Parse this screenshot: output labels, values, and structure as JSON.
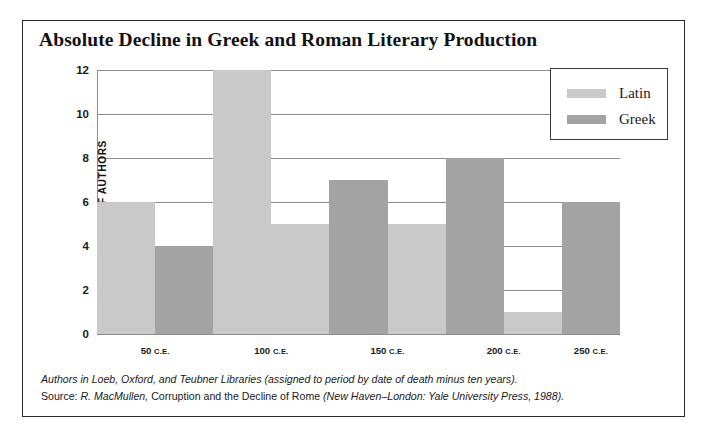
{
  "figure": {
    "title": "Absolute Decline in Greek and Roman Literary Production"
  },
  "legend": {
    "position": "top-right",
    "entries": [
      {
        "label": "Latin",
        "color": "#c9c9c9",
        "swatch_name": "latin-swatch"
      },
      {
        "label": "Greek",
        "color": "#a3a3a3",
        "swatch_name": "greek-swatch"
      }
    ]
  },
  "footnote": {
    "line1": "Authors in Loeb, Oxford, and Teubner Libraries (assigned to period by date of death minus ten years).",
    "line2_source_label": "Source:",
    "line2_author": "R. MacMullen,",
    "line2_work": "Corruption and the Decline of Rome",
    "line2_publication": "(New Haven–London: Yale University Press, 1988)."
  },
  "chart_data": {
    "type": "bar",
    "title": "Absolute Decline in Greek and Roman Literary Production",
    "xlabel": "",
    "ylabel": "NUMBER OF AUTHORS",
    "ylim": [
      0,
      12
    ],
    "yticks": [
      0,
      2,
      4,
      6,
      8,
      10,
      12
    ],
    "ytick_labels": [
      "0",
      "2",
      "4",
      "6",
      "8",
      "10",
      "12"
    ],
    "grid": true,
    "grid_axis": "y",
    "categories": [
      "50 C.E.",
      "100 C.E.",
      "150 C.E.",
      "200 C.E.",
      "250 C.E."
    ],
    "category_numbers": [
      "50",
      "100",
      "150",
      "200",
      "250"
    ],
    "era_suffix": "C.E.",
    "series": [
      {
        "name": "Latin",
        "color": "#c9c9c9",
        "values": [
          6,
          12,
          5,
          1,
          0
        ]
      },
      {
        "name": "Greek",
        "color": "#a3a3a3",
        "values": [
          4,
          5,
          7,
          8,
          6
        ]
      }
    ],
    "bars": [
      {
        "group": "50 C.E.",
        "series": "Latin",
        "value": 6,
        "order": 0
      },
      {
        "group": "50 C.E.",
        "series": "Greek",
        "value": 4,
        "order": 1
      },
      {
        "group": "100 C.E.",
        "series": "Latin",
        "value": 12,
        "order": 2
      },
      {
        "group": "100 C.E.",
        "series": "Latin",
        "value": 5,
        "order": 3
      },
      {
        "group": "150 C.E.",
        "series": "Greek",
        "value": 7,
        "order": 4
      },
      {
        "group": "150 C.E.",
        "series": "Latin",
        "value": 5,
        "order": 5
      },
      {
        "group": "200 C.E.",
        "series": "Greek",
        "value": 8,
        "order": 6
      },
      {
        "group": "200 C.E.",
        "series": "Latin",
        "value": 1,
        "order": 7
      },
      {
        "group": "250 C.E.",
        "series": "Greek",
        "value": 6,
        "order": 8
      }
    ]
  }
}
